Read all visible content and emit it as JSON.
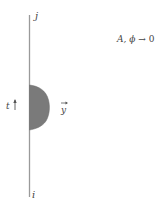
{
  "diagram": {
    "top_label": "j",
    "bottom_label": "i",
    "condition": {
      "vars": "A, ϕ",
      "arrow": "→",
      "value": "0"
    },
    "time_label": "t",
    "vector_label": "y",
    "colors": {
      "line": "#9a9a9a",
      "blob": "#7a7a7a",
      "text": "#444444"
    }
  }
}
